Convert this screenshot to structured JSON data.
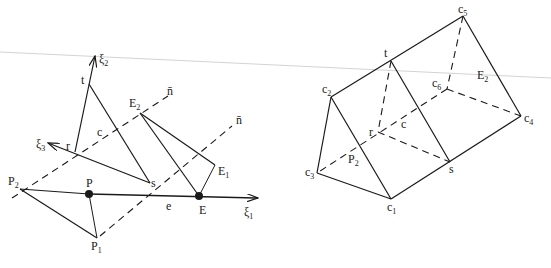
{
  "colors": {
    "ink": "#1a1a1a",
    "background": "#ffffff"
  },
  "left_diagram": {
    "axes": [
      {
        "id": "xi1",
        "label": "ξ",
        "sub": "1"
      },
      {
        "id": "xi2",
        "label": "ξ",
        "sub": "2"
      },
      {
        "id": "xi3",
        "label": "ξ",
        "sub": "3"
      }
    ],
    "points": {
      "t": {
        "label": "t"
      },
      "r": {
        "label": "r"
      },
      "s": {
        "label": "s"
      },
      "c": {
        "label": "c"
      },
      "E2": {
        "label": "E",
        "sub": "2"
      },
      "E1": {
        "label": "E",
        "sub": "1"
      },
      "E": {
        "label": "E"
      },
      "P": {
        "label": "P"
      },
      "P1": {
        "label": "P",
        "sub": "1"
      },
      "P2": {
        "label": "P",
        "sub": "2"
      },
      "e": {
        "label": "e"
      }
    },
    "normal_labels": [
      {
        "label": "n̄"
      },
      {
        "label": "n̄"
      }
    ]
  },
  "right_diagram": {
    "points": {
      "c1": {
        "label": "c",
        "sub": "1"
      },
      "c2": {
        "label": "c",
        "sub": "2"
      },
      "c3": {
        "label": "c",
        "sub": "3"
      },
      "c4": {
        "label": "c",
        "sub": "4"
      },
      "c5": {
        "label": "c",
        "sub": "5"
      },
      "c6": {
        "label": "c",
        "sub": "6"
      },
      "t": {
        "label": "t"
      },
      "r": {
        "label": "r"
      },
      "s": {
        "label": "s"
      },
      "c": {
        "label": "c"
      },
      "E2": {
        "label": "E",
        "sub": "2"
      },
      "P2": {
        "label": "P",
        "sub": "2"
      }
    }
  }
}
